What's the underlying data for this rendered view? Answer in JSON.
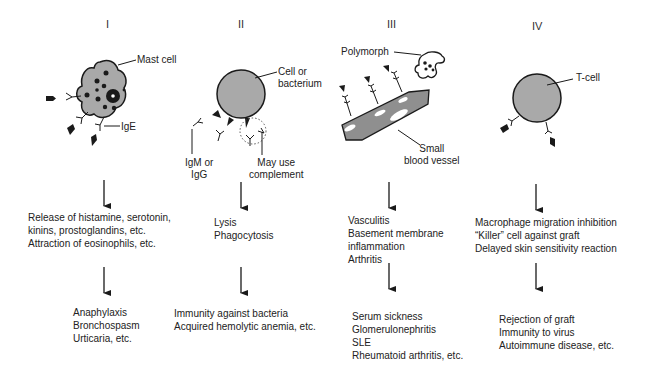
{
  "diagram": {
    "columns": [
      {
        "numeral": "I",
        "cell_label": "Mast cell",
        "antibody_label": "IgE",
        "effects": [
          "Release of histamine, serotonin,",
          "kinins, prostoglandins, etc.",
          "Attraction of eosinophils, etc."
        ],
        "outcomes": [
          "Anaphylaxis",
          "Bronchospasm",
          "Urticaria, etc."
        ]
      },
      {
        "numeral": "II",
        "cell_label_line1": "Cell or",
        "cell_label_line2": "bacterium",
        "antibody_label_line1": "IgM or",
        "antibody_label_line2": "IgG",
        "complement_label_line1": "May use",
        "complement_label_line2": "complement",
        "effects": [
          "Lysis",
          "Phagocytosis"
        ],
        "outcomes": [
          "Immunity against bacteria",
          "Acquired hemolytic anemia, etc."
        ]
      },
      {
        "numeral": "III",
        "polymorph_label": "Polymorph",
        "vessel_label_line1": "Small",
        "vessel_label_line2": "blood vessel",
        "effects": [
          "Vasculitis",
          "Basement membrane",
          "inflammation",
          "Arthritis"
        ],
        "outcomes": [
          "Serum sickness",
          "Glomerulonephritis",
          "SLE",
          "Rheumatoid arthritis, etc."
        ]
      },
      {
        "numeral": "IV",
        "cell_label": "T-cell",
        "effects": [
          "Macrophage migration inhibition",
          "“Killer” cell against graft",
          "Delayed skin sensitivity reaction"
        ],
        "outcomes": [
          "Rejection of graft",
          "Immunity to virus",
          "Autoimmune disease, etc."
        ]
      }
    ]
  },
  "colors": {
    "cell_fill": "#a9a9a9",
    "outline": "#1a1a1a",
    "text": "#222222",
    "background": "#ffffff"
  }
}
